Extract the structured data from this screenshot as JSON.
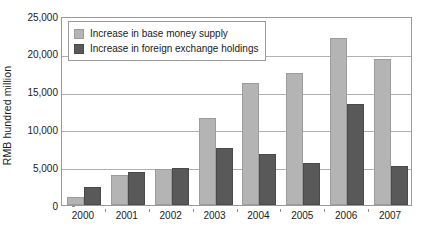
{
  "chart_data": {
    "type": "bar",
    "title": "",
    "xlabel": "",
    "ylabel": "RMB hundred million",
    "categories": [
      "2000",
      "2001",
      "2002",
      "2003",
      "2004",
      "2005",
      "2006",
      "2007"
    ],
    "series": [
      {
        "name": "Increase in base money supply",
        "color": "#b4b4b4",
        "values": [
          1000,
          4000,
          4700,
          11500,
          16200,
          17500,
          22100,
          19300
        ]
      },
      {
        "name": "Increase in foreign exchange holdings",
        "color": "#595959",
        "values": [
          2400,
          4400,
          4900,
          7500,
          6700,
          5600,
          13400,
          5100
        ]
      }
    ],
    "ylim": [
      0,
      25000
    ],
    "ytick_values": [
      0,
      5000,
      10000,
      15000,
      20000,
      25000
    ],
    "ytick_labels": [
      "0",
      "5,000",
      "10,000",
      "15,000",
      "20,000",
      "25,000"
    ],
    "grid": true,
    "grid_axis": "y",
    "legend_position": "top-left-inside"
  }
}
